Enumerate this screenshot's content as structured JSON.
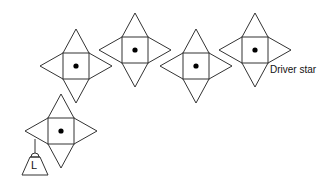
{
  "diagram": {
    "type": "star-chain",
    "stroke_color": "#333333",
    "stars": [
      {
        "id": "star-1",
        "cx": 76,
        "cy": 66
      },
      {
        "id": "star-2",
        "cx": 135,
        "cy": 50
      },
      {
        "id": "star-3",
        "cx": 196,
        "cy": 66
      },
      {
        "id": "star-4",
        "cx": 255,
        "cy": 50,
        "role": "driver"
      },
      {
        "id": "star-5",
        "cx": 61,
        "cy": 131,
        "role": "load"
      }
    ],
    "labels": {
      "driver": "Driver star",
      "load": "L"
    }
  }
}
